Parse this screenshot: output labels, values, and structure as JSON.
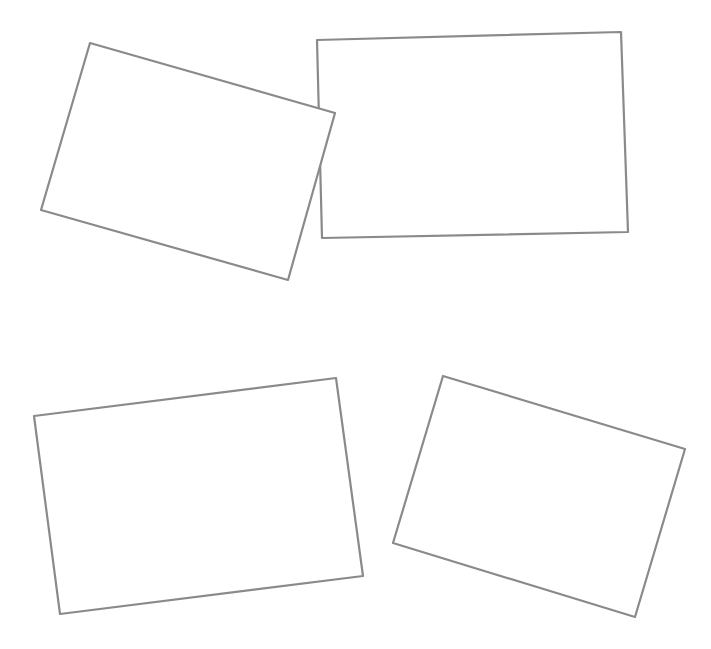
{
  "canvas": {
    "width": 711,
    "height": 649,
    "background": "#ffffff"
  },
  "style": {
    "stroke_color": "#8a8a8a",
    "fill_color": "#ffffff",
    "stroke_width": 2.2
  },
  "shapes": [
    {
      "id": "rect-top-right",
      "type": "quadrilateral",
      "points": "317,40 621,32 628,232 322,238"
    },
    {
      "id": "rect-top-left",
      "type": "quadrilateral",
      "points": "90,43 335,113 288,280 41,210"
    },
    {
      "id": "rect-bottom-left",
      "type": "quadrilateral",
      "points": "34,416 336,378 363,576 60,614"
    },
    {
      "id": "rect-bottom-right",
      "type": "quadrilateral",
      "points": "443,376 685,449 635,617 393,543"
    }
  ]
}
